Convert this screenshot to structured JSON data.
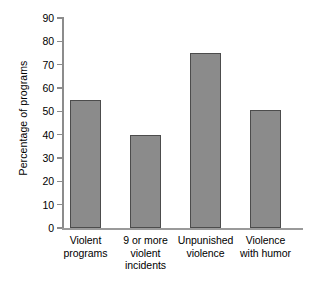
{
  "chart_data": {
    "type": "bar",
    "title": "",
    "subtitle": "",
    "xlabel": "",
    "ylabel": "Percentage of programs",
    "ylim": [
      0,
      90
    ],
    "yticks": [
      0,
      10,
      20,
      30,
      40,
      50,
      60,
      70,
      80,
      90
    ],
    "ytick_labels": [
      "0",
      "10",
      "20",
      "30",
      "40",
      "50",
      "60",
      "70",
      "80",
      "90"
    ],
    "grid": false,
    "legend": null,
    "categories": [
      "Violent\nprograms",
      "9 or more\nviolent\nincidents",
      "Unpunished\nviolence",
      "Violence\nwith humor"
    ],
    "values": [
      55,
      40,
      75,
      50.5
    ],
    "bars": [
      {
        "label": "Violent\nprograms",
        "value": 55
      },
      {
        "label": "9 or more\nviolent\nincidents",
        "value": 40
      },
      {
        "label": "Unpunished\nviolence",
        "value": 75
      },
      {
        "label": "Violence\nwith humor",
        "value": 50.5
      }
    ],
    "colors": {
      "bar_fill": "#8b8b8b",
      "bar_edge": "#4c4c4c",
      "axis": "#8c8c8c",
      "background": "#ffffff",
      "text": "#000000"
    }
  }
}
